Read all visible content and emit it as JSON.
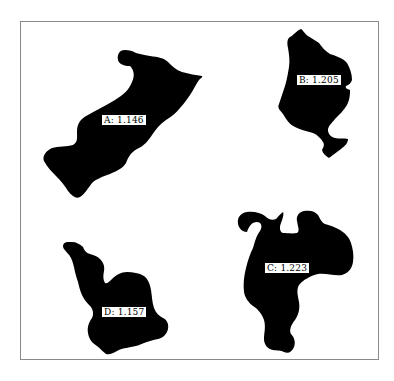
{
  "figure": {
    "background": "#ffffff",
    "frame_color": "#8a8a8a",
    "shape_color": "#000000"
  },
  "regions": [
    {
      "id": "A",
      "value": "1.146",
      "label": "A: 1.146"
    },
    {
      "id": "B",
      "value": "1.205",
      "label": "B: 1.205"
    },
    {
      "id": "C",
      "value": "1.223",
      "label": "C: 1.223"
    },
    {
      "id": "D",
      "value": "1.157",
      "label": "D: 1.157"
    }
  ]
}
